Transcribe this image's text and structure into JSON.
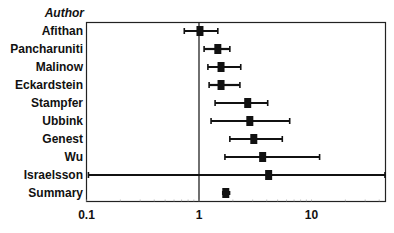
{
  "chart_data": {
    "type": "forest",
    "column_header": "Author",
    "xscale": "log",
    "xlim": [
      0.1,
      45
    ],
    "reference_line": 1,
    "xticks": [
      0.1,
      1,
      10
    ],
    "xtick_labels": [
      "0.1",
      "1",
      "10"
    ],
    "xlabel": "",
    "grid": false,
    "studies": [
      {
        "label": "Afithan",
        "estimate": 1.02,
        "ci_low": 0.74,
        "ci_high": 1.47
      },
      {
        "label": "Pancharuniti",
        "estimate": 1.47,
        "ci_low": 1.11,
        "ci_high": 1.88
      },
      {
        "label": "Malinow",
        "estimate": 1.57,
        "ci_low": 1.2,
        "ci_high": 2.35
      },
      {
        "label": "Eckardstein",
        "estimate": 1.57,
        "ci_low": 1.23,
        "ci_high": 2.31
      },
      {
        "label": "Stampfer",
        "estimate": 2.71,
        "ci_low": 1.39,
        "ci_high": 4.08
      },
      {
        "label": "Ubbink",
        "estimate": 2.83,
        "ci_low": 1.28,
        "ci_high": 6.4
      },
      {
        "label": "Genest",
        "estimate": 3.07,
        "ci_low": 1.88,
        "ci_high": 5.5
      },
      {
        "label": "Wu",
        "estimate": 3.68,
        "ci_low": 1.7,
        "ci_high": 11.8
      },
      {
        "label": "Israelsson",
        "estimate": 4.16,
        "ci_low": 0.104,
        "ci_high": 45
      }
    ],
    "summary": {
      "label": "Summary",
      "estimate": 1.73,
      "ci_low": 1.6,
      "ci_high": 1.9
    }
  }
}
